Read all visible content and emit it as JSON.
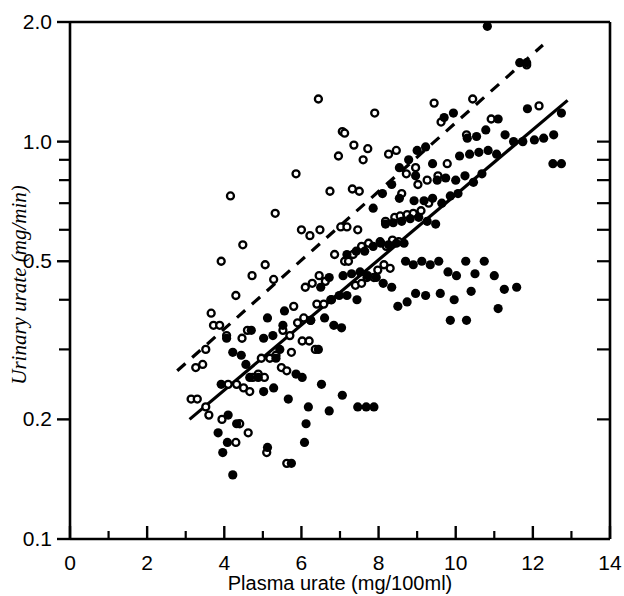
{
  "chart_data": {
    "type": "scatter",
    "title": "",
    "xlabel": "Plasma urate (mg/100ml)",
    "ylabel": "Urinary urate (mg/min)",
    "xscale": "linear",
    "yscale": "log",
    "xlim": [
      0,
      14
    ],
    "ylim": [
      0.1,
      2.0
    ],
    "grid": false,
    "legend_position": "none",
    "x_ticks_major": [
      0,
      2,
      4,
      6,
      8,
      10,
      12,
      14
    ],
    "x_ticks_minor": [
      1,
      3,
      5,
      7,
      9,
      11,
      13
    ],
    "x_tick_labels": [
      "0",
      "2",
      "4",
      "6",
      "8",
      "10",
      "12",
      "14"
    ],
    "y_ticks_major": [
      0.1,
      0.2,
      0.5,
      1.0,
      2.0
    ],
    "y_tick_labels": [
      "0.1",
      "0.2",
      "0.5",
      "1.0",
      "2.0"
    ],
    "y_ticks_minor": [
      0.3,
      0.4,
      0.6,
      0.7,
      0.8,
      0.9
    ],
    "series": [
      {
        "name": "open-circles",
        "marker": "open-circle",
        "color": "#000000",
        "points": [
          [
            6.44,
            1.28
          ],
          [
            7.06,
            1.06
          ],
          [
            7.12,
            1.05
          ],
          [
            5.86,
            0.83
          ],
          [
            6.74,
            0.75
          ],
          [
            7.32,
            0.76
          ],
          [
            7.5,
            0.75
          ],
          [
            5.32,
            0.66
          ],
          [
            6.0,
            0.6
          ],
          [
            6.22,
            0.58
          ],
          [
            6.48,
            0.6
          ],
          [
            7.02,
            0.61
          ],
          [
            7.18,
            0.61
          ],
          [
            7.46,
            0.6
          ],
          [
            5.06,
            0.49
          ],
          [
            7.12,
            0.5
          ],
          [
            7.22,
            0.5
          ],
          [
            6.86,
            0.52
          ],
          [
            5.28,
            0.45
          ],
          [
            4.72,
            0.46
          ],
          [
            4.48,
            0.55
          ],
          [
            4.16,
            0.73
          ],
          [
            3.92,
            0.5
          ],
          [
            4.3,
            0.41
          ],
          [
            3.66,
            0.37
          ],
          [
            3.72,
            0.345
          ],
          [
            3.88,
            0.345
          ],
          [
            4.06,
            0.325
          ],
          [
            4.46,
            0.32
          ],
          [
            4.6,
            0.335
          ],
          [
            3.52,
            0.3
          ],
          [
            3.44,
            0.275
          ],
          [
            3.26,
            0.27
          ],
          [
            3.14,
            0.225
          ],
          [
            3.3,
            0.225
          ],
          [
            3.52,
            0.215
          ],
          [
            3.6,
            0.205
          ],
          [
            3.94,
            0.2
          ],
          [
            4.1,
            0.245
          ],
          [
            4.32,
            0.245
          ],
          [
            4.5,
            0.24
          ],
          [
            4.66,
            0.235
          ],
          [
            4.74,
            0.255
          ],
          [
            4.88,
            0.26
          ],
          [
            5.04,
            0.255
          ],
          [
            4.96,
            0.285
          ],
          [
            5.18,
            0.285
          ],
          [
            5.34,
            0.29
          ],
          [
            5.48,
            0.27
          ],
          [
            5.62,
            0.265
          ],
          [
            5.74,
            0.295
          ],
          [
            4.4,
            0.195
          ],
          [
            4.62,
            0.185
          ],
          [
            4.3,
            0.175
          ],
          [
            5.1,
            0.165
          ],
          [
            5.62,
            0.155
          ],
          [
            5.9,
            0.35
          ],
          [
            6.06,
            0.36
          ],
          [
            6.24,
            0.355
          ],
          [
            6.4,
            0.39
          ],
          [
            6.58,
            0.39
          ],
          [
            6.78,
            0.4
          ],
          [
            6.1,
            0.43
          ],
          [
            6.28,
            0.44
          ],
          [
            6.46,
            0.46
          ],
          [
            6.62,
            0.445
          ],
          [
            6.02,
            0.315
          ],
          [
            6.2,
            0.315
          ],
          [
            6.36,
            0.3
          ],
          [
            5.7,
            0.325
          ],
          [
            5.52,
            0.335
          ],
          [
            5.8,
            0.385
          ],
          [
            7.4,
            0.435
          ],
          [
            7.56,
            0.44
          ],
          [
            7.7,
            0.455
          ],
          [
            7.88,
            0.455
          ],
          [
            7.98,
            0.475
          ],
          [
            8.14,
            0.49
          ],
          [
            8.3,
            0.48
          ],
          [
            7.34,
            0.52
          ],
          [
            7.56,
            0.545
          ],
          [
            7.74,
            0.555
          ],
          [
            8.04,
            0.56
          ],
          [
            8.2,
            0.545
          ],
          [
            8.36,
            0.565
          ],
          [
            8.52,
            0.56
          ],
          [
            8.18,
            0.63
          ],
          [
            8.42,
            0.645
          ],
          [
            8.56,
            0.65
          ],
          [
            8.74,
            0.655
          ],
          [
            8.9,
            0.66
          ],
          [
            9.1,
            0.67
          ],
          [
            9.3,
            0.7
          ],
          [
            9.02,
            0.78
          ],
          [
            9.26,
            0.8
          ],
          [
            8.72,
            0.83
          ],
          [
            9.54,
            0.82
          ],
          [
            9.78,
            0.88
          ],
          [
            8.26,
            0.93
          ],
          [
            8.46,
            0.95
          ],
          [
            8.96,
            0.86
          ],
          [
            10.28,
            1.04
          ],
          [
            10.44,
            1.28
          ],
          [
            11.84,
            1.56
          ],
          [
            12.16,
            1.23
          ],
          [
            9.62,
            1.12
          ],
          [
            7.9,
            1.18
          ],
          [
            9.44,
            1.25
          ],
          [
            6.96,
            0.92
          ],
          [
            7.36,
            0.98
          ],
          [
            7.72,
            0.96
          ],
          [
            7.6,
            0.9
          ],
          [
            8.6,
            0.74
          ],
          [
            10.92,
            1.14
          ]
        ]
      },
      {
        "name": "filled-circles",
        "marker": "filled-circle",
        "color": "#000000",
        "points": [
          [
            3.92,
            0.245
          ],
          [
            4.1,
            0.205
          ],
          [
            4.32,
            0.195
          ],
          [
            3.84,
            0.185
          ],
          [
            4.08,
            0.175
          ],
          [
            3.96,
            0.165
          ],
          [
            4.22,
            0.145
          ],
          [
            5.12,
            0.17
          ],
          [
            5.66,
            0.225
          ],
          [
            4.66,
            0.255
          ],
          [
            4.88,
            0.255
          ],
          [
            4.56,
            0.275
          ],
          [
            4.22,
            0.295
          ],
          [
            4.44,
            0.29
          ],
          [
            4.06,
            0.32
          ],
          [
            4.7,
            0.335
          ],
          [
            5.02,
            0.32
          ],
          [
            5.34,
            0.285
          ],
          [
            5.44,
            0.3
          ],
          [
            5.26,
            0.325
          ],
          [
            5.52,
            0.345
          ],
          [
            5.12,
            0.36
          ],
          [
            5.56,
            0.375
          ],
          [
            5.86,
            0.26
          ],
          [
            6.02,
            0.255
          ],
          [
            6.44,
            0.3
          ],
          [
            6.24,
            0.355
          ],
          [
            6.6,
            0.36
          ],
          [
            6.84,
            0.345
          ],
          [
            7.04,
            0.34
          ],
          [
            6.76,
            0.4
          ],
          [
            6.98,
            0.41
          ],
          [
            7.18,
            0.41
          ],
          [
            7.44,
            0.4
          ],
          [
            6.5,
            0.43
          ],
          [
            6.72,
            0.455
          ],
          [
            7.08,
            0.46
          ],
          [
            7.3,
            0.465
          ],
          [
            7.52,
            0.47
          ],
          [
            7.72,
            0.46
          ],
          [
            7.94,
            0.455
          ],
          [
            8.12,
            0.44
          ],
          [
            8.34,
            0.43
          ],
          [
            7.18,
            0.52
          ],
          [
            7.42,
            0.53
          ],
          [
            7.64,
            0.53
          ],
          [
            7.86,
            0.545
          ],
          [
            8.06,
            0.555
          ],
          [
            8.26,
            0.55
          ],
          [
            8.46,
            0.555
          ],
          [
            8.66,
            0.555
          ],
          [
            8.18,
            0.62
          ],
          [
            8.38,
            0.625
          ],
          [
            8.6,
            0.63
          ],
          [
            8.82,
            0.64
          ],
          [
            9.04,
            0.645
          ],
          [
            9.26,
            0.63
          ],
          [
            9.48,
            0.62
          ],
          [
            8.92,
            0.71
          ],
          [
            9.18,
            0.71
          ],
          [
            9.4,
            0.72
          ],
          [
            9.64,
            0.7
          ],
          [
            9.86,
            0.73
          ],
          [
            10.06,
            0.74
          ],
          [
            9.52,
            0.8
          ],
          [
            9.74,
            0.81
          ],
          [
            10.0,
            0.8
          ],
          [
            10.24,
            0.82
          ],
          [
            10.46,
            0.79
          ],
          [
            10.68,
            0.83
          ],
          [
            10.1,
            0.92
          ],
          [
            10.36,
            0.93
          ],
          [
            10.6,
            0.94
          ],
          [
            10.84,
            0.95
          ],
          [
            11.06,
            0.93
          ],
          [
            10.3,
            1.02
          ],
          [
            10.54,
            1.03
          ],
          [
            11.28,
            1.04
          ],
          [
            11.5,
            1.0
          ],
          [
            11.74,
            1.0
          ],
          [
            12.04,
            1.01
          ],
          [
            12.28,
            1.02
          ],
          [
            12.54,
            1.04
          ],
          [
            12.74,
            1.18
          ],
          [
            11.86,
            1.21
          ],
          [
            10.78,
            1.07
          ],
          [
            11.1,
            1.14
          ],
          [
            11.66,
            1.58
          ],
          [
            11.84,
            1.58
          ],
          [
            10.82,
            1.95
          ],
          [
            9.94,
            1.18
          ],
          [
            9.7,
            1.15
          ],
          [
            9.22,
            0.97
          ],
          [
            9.0,
            0.95
          ],
          [
            8.78,
            0.9
          ],
          [
            8.54,
            0.86
          ],
          [
            8.96,
            0.82
          ],
          [
            9.4,
            0.88
          ],
          [
            8.34,
            0.78
          ],
          [
            8.1,
            0.74
          ],
          [
            7.86,
            0.68
          ],
          [
            8.54,
            0.72
          ],
          [
            8.7,
            0.5
          ],
          [
            8.9,
            0.49
          ],
          [
            9.12,
            0.5
          ],
          [
            9.34,
            0.49
          ],
          [
            9.56,
            0.5
          ],
          [
            9.8,
            0.47
          ],
          [
            10.02,
            0.46
          ],
          [
            10.26,
            0.5
          ],
          [
            10.5,
            0.465
          ],
          [
            10.74,
            0.5
          ],
          [
            11.0,
            0.46
          ],
          [
            8.96,
            0.415
          ],
          [
            9.22,
            0.41
          ],
          [
            9.6,
            0.415
          ],
          [
            9.96,
            0.4
          ],
          [
            10.4,
            0.42
          ],
          [
            8.74,
            0.395
          ],
          [
            8.5,
            0.385
          ],
          [
            9.86,
            0.355
          ],
          [
            10.28,
            0.355
          ],
          [
            11.26,
            0.425
          ],
          [
            11.58,
            0.43
          ],
          [
            11.1,
            0.38
          ],
          [
            6.18,
            0.215
          ],
          [
            6.12,
            0.195
          ],
          [
            6.08,
            0.175
          ],
          [
            5.74,
            0.155
          ],
          [
            6.72,
            0.21
          ],
          [
            7.46,
            0.215
          ],
          [
            7.68,
            0.215
          ],
          [
            7.88,
            0.215
          ],
          [
            7.06,
            0.23
          ],
          [
            6.52,
            0.245
          ],
          [
            5.02,
            0.235
          ],
          [
            5.28,
            0.24
          ],
          [
            12.52,
            0.88
          ],
          [
            12.74,
            0.88
          ]
        ]
      }
    ],
    "lines": [
      {
        "name": "solid-regression-line",
        "style": "solid",
        "color": "#000000",
        "x1": 3.1,
        "y1": 0.2,
        "x2": 12.9,
        "y2": 1.27
      },
      {
        "name": "dashed-regression-line",
        "style": "dashed",
        "color": "#000000",
        "x1": 2.78,
        "y1": 0.265,
        "x2": 12.26,
        "y2": 1.75
      }
    ]
  }
}
